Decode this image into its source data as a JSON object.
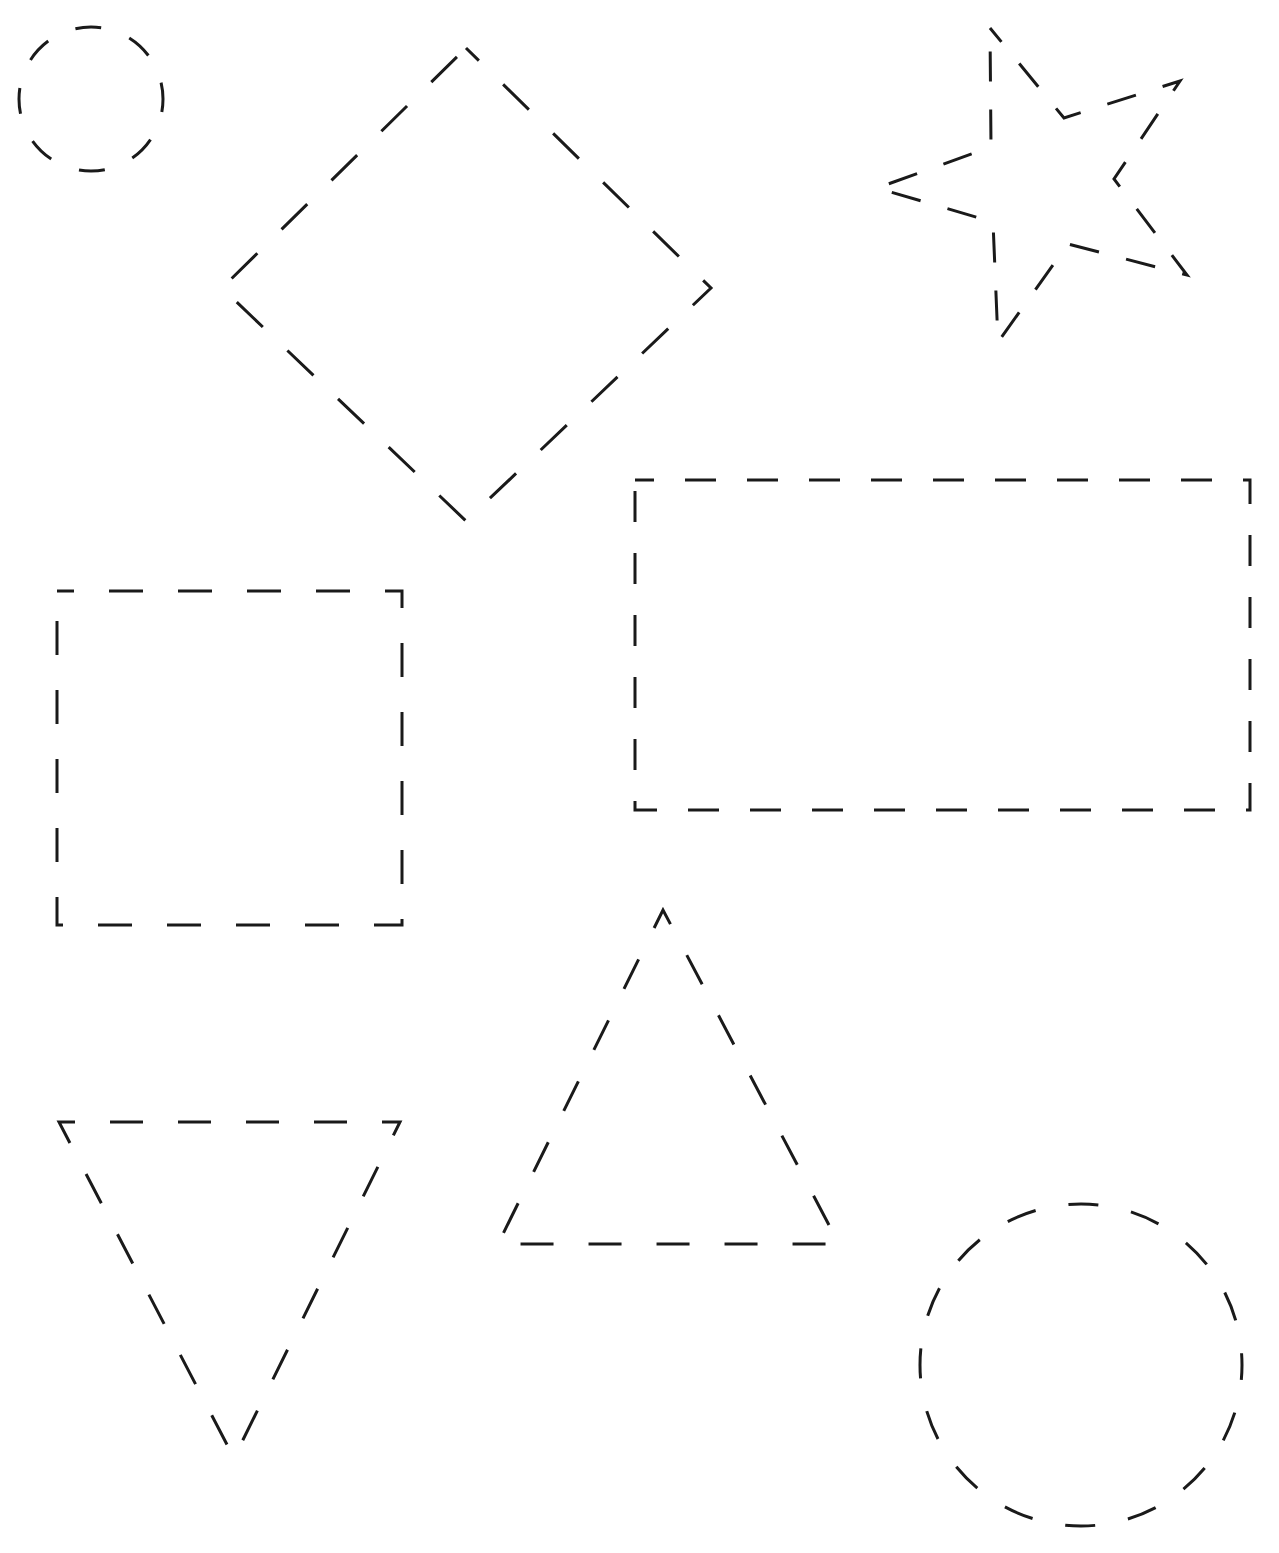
{
  "worksheet": {
    "title": "",
    "background": "#ffffff",
    "stroke_color": "#1a1a1a",
    "stroke_width": 3,
    "footer_text": ""
  },
  "shapes": [
    {
      "id": "small-circle",
      "type": "circle",
      "cx": 91,
      "cy": 99,
      "r": 72,
      "dash": "26 30",
      "dash_offset": 13
    },
    {
      "id": "diamond",
      "type": "polygon",
      "points": "466,48 711,288 466,521 222,288",
      "dash": "36 34",
      "dash_offset": 18
    },
    {
      "id": "star",
      "type": "polygon",
      "points": "990,28 1064,118 1180,81 1114,179 1187,275 1068,244 998,342 993,222 877,188 991,147",
      "dash": "30 28",
      "dash_offset": 12
    },
    {
      "id": "square",
      "type": "polygon",
      "points": "57,591 402,591 402,925 57,925",
      "dash": "34 35",
      "dash_offset": 17
    },
    {
      "id": "rectangle",
      "type": "polygon",
      "points": "635,480 1250,480 1250,810 635,810",
      "dash": "31 31",
      "dash_offset": 12
    },
    {
      "id": "upright-triangle",
      "type": "polygon",
      "points": "663,910 839,1244 498,1244",
      "dash": "33 35",
      "dash_offset": 17
    },
    {
      "id": "inverted-triangle",
      "type": "polygon",
      "points": "59,1122 400,1122 234,1458",
      "dash": "33 35",
      "dash_offset": 17
    },
    {
      "id": "large-circle",
      "type": "circle",
      "cx": 1081,
      "cy": 1365,
      "r": 161,
      "dash": "30 33.4",
      "dash_offset": 15
    }
  ]
}
